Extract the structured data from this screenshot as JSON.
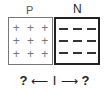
{
  "diagram": {
    "p_region": {
      "label": "P",
      "symbols": [
        "+",
        "+",
        "+",
        "+",
        "+",
        "+",
        "+",
        "+",
        "+"
      ]
    },
    "n_region": {
      "label": "N",
      "symbols": [
        "−",
        "−",
        "−",
        "−",
        "−",
        "−",
        "−",
        "−",
        "−"
      ]
    },
    "bottom": {
      "left_unknown": "?",
      "left_arrow": "⟵",
      "current_label": "I",
      "right_arrow": "⟶",
      "right_unknown": "?"
    },
    "colors": {
      "p_border": "#777777",
      "n_border": "#222222",
      "background": "#ffffff"
    }
  }
}
